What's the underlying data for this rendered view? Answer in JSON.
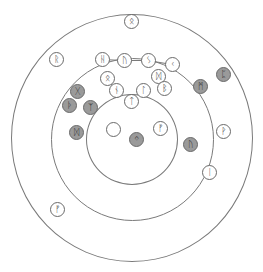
{
  "diagram": {
    "title": "",
    "rings": [
      {
        "name": "outer-ring",
        "cx": 131.5,
        "cy": 137.5,
        "r": 121
      },
      {
        "name": "middle-ring",
        "cx": 132,
        "cy": 139.5,
        "r": 81
      },
      {
        "name": "inner-ring",
        "cx": 131.5,
        "cy": 139,
        "r": 45.5
      }
    ],
    "colors": {
      "ring": "#7a7a7a",
      "filled": "#9a9a9a",
      "empty": "#ffffff"
    },
    "runes": [
      {
        "id": "othala-top",
        "glyph": "ᛟ",
        "x": 131,
        "y": 21,
        "filled": false
      },
      {
        "id": "raido",
        "glyph": "ᚱ",
        "x": 56,
        "y": 59,
        "filled": false
      },
      {
        "id": "hagalaz",
        "glyph": "ᚺ",
        "x": 102,
        "y": 59,
        "filled": false
      },
      {
        "id": "uruz",
        "glyph": "ᚢ",
        "x": 124,
        "y": 60,
        "filled": false
      },
      {
        "id": "sowilo",
        "glyph": "ᛊ",
        "x": 148,
        "y": 60,
        "filled": false
      },
      {
        "id": "kenaz",
        "glyph": "ᚲ",
        "x": 172,
        "y": 64,
        "filled": false
      },
      {
        "id": "dagaz-upper",
        "glyph": "ᛞ",
        "x": 158,
        "y": 76,
        "filled": false
      },
      {
        "id": "othala",
        "glyph": "ᛟ",
        "x": 107,
        "y": 78,
        "filled": false
      },
      {
        "id": "nauthiz",
        "glyph": "ᚾ",
        "x": 116,
        "y": 90,
        "filled": false
      },
      {
        "id": "laguz",
        "glyph": "ᛚ",
        "x": 143,
        "y": 90,
        "filled": false
      },
      {
        "id": "berkano",
        "glyph": "ᛒ",
        "x": 164,
        "y": 88,
        "filled": false
      },
      {
        "id": "tiwaz",
        "glyph": "ᛏ",
        "x": 131,
        "y": 101,
        "filled": false
      },
      {
        "id": "gebo",
        "glyph": "ᚷ",
        "x": 77,
        "y": 91,
        "filled": true
      },
      {
        "id": "thurisaz",
        "glyph": "ᚦ",
        "x": 69,
        "y": 105,
        "filled": true
      },
      {
        "id": "algiz",
        "glyph": "ᛉ",
        "x": 90,
        "y": 107,
        "filled": true
      },
      {
        "id": "mannaz",
        "glyph": "ᛗ",
        "x": 200,
        "y": 86,
        "filled": true
      },
      {
        "id": "perthro",
        "glyph": "ᛈ",
        "x": 223,
        "y": 74,
        "filled": true
      },
      {
        "id": "dagaz",
        "glyph": "ᛞ",
        "x": 76,
        "y": 132,
        "filled": true
      },
      {
        "id": "blank",
        "glyph": "",
        "x": 113,
        "y": 129,
        "filled": false
      },
      {
        "id": "ingwaz",
        "glyph": "ᛜ",
        "x": 136,
        "y": 139,
        "filled": true
      },
      {
        "id": "fehu-inner",
        "glyph": "ᚠ",
        "x": 160,
        "y": 128,
        "filled": false
      },
      {
        "id": "uruz-gray",
        "glyph": "ᚢ",
        "x": 190,
        "y": 144,
        "filled": true
      },
      {
        "id": "wunjo",
        "glyph": "ᚹ",
        "x": 223,
        "y": 131,
        "filled": false
      },
      {
        "id": "isa",
        "glyph": "ᛁ",
        "x": 209,
        "y": 172,
        "filled": false
      },
      {
        "id": "fehu-outer",
        "glyph": "ᚠ",
        "x": 57,
        "y": 209,
        "filled": false
      }
    ],
    "links": [
      {
        "from": "hagalaz",
        "to": "uruz"
      },
      {
        "from": "uruz",
        "to": "sowilo"
      },
      {
        "from": "sowilo",
        "to": "kenaz"
      },
      {
        "from": "othala",
        "to": "nauthiz"
      }
    ]
  }
}
